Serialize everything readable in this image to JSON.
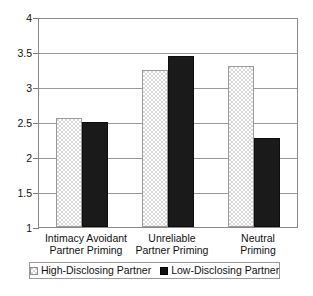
{
  "chart_data": {
    "type": "bar",
    "title": "",
    "subtitle": "",
    "xlabel": "",
    "ylabel": "",
    "ylim": [
      1,
      4
    ],
    "ytick_labels": [
      "4",
      "3.5",
      "3",
      "2.5",
      "2",
      "1.5",
      "1"
    ],
    "ytick_values": [
      4,
      3.5,
      3,
      2.5,
      2,
      1.5,
      1
    ],
    "grid": true,
    "legend_position": "bottom",
    "categories": [
      "Intimacy Avoidant Partner Priming",
      "Unreliable Partner Priming",
      "Neutral Priming"
    ],
    "category_lines": [
      [
        "Intimacy Avoidant",
        "Partner Priming"
      ],
      [
        "Unreliable",
        "Partner Priming"
      ],
      [
        "Neutral",
        "Priming"
      ]
    ],
    "series": [
      {
        "name": "High-Disclosing Partner",
        "pattern": "checkered",
        "color": "#d8d8d8",
        "values": [
          2.57,
          3.26,
          3.31
        ]
      },
      {
        "name": "Low-Disclosing Partner",
        "pattern": "solid",
        "color": "#1a1a1a",
        "values": [
          2.51,
          3.46,
          2.28
        ]
      }
    ]
  },
  "legend": {
    "entries": [
      {
        "label": "High-Disclosing Partner"
      },
      {
        "label": "Low-Disclosing Partner"
      }
    ]
  }
}
